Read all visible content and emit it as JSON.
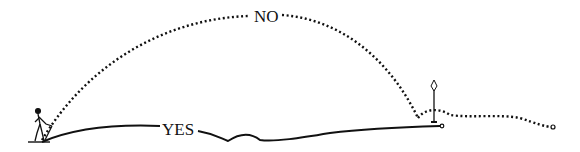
{
  "diagram": {
    "labels": {
      "no": "NO",
      "yes": "YES"
    },
    "elements": [
      {
        "name": "golfer",
        "kind": "figure"
      },
      {
        "name": "no-path",
        "kind": "dotted-arc",
        "label": "NO"
      },
      {
        "name": "yes-path",
        "kind": "solid-ground-line",
        "label": "YES"
      },
      {
        "name": "flag",
        "kind": "pin-flag"
      },
      {
        "name": "rolloff-path",
        "kind": "dotted-line"
      }
    ],
    "colors": {
      "ink": "#111111",
      "background": "#ffffff"
    }
  }
}
